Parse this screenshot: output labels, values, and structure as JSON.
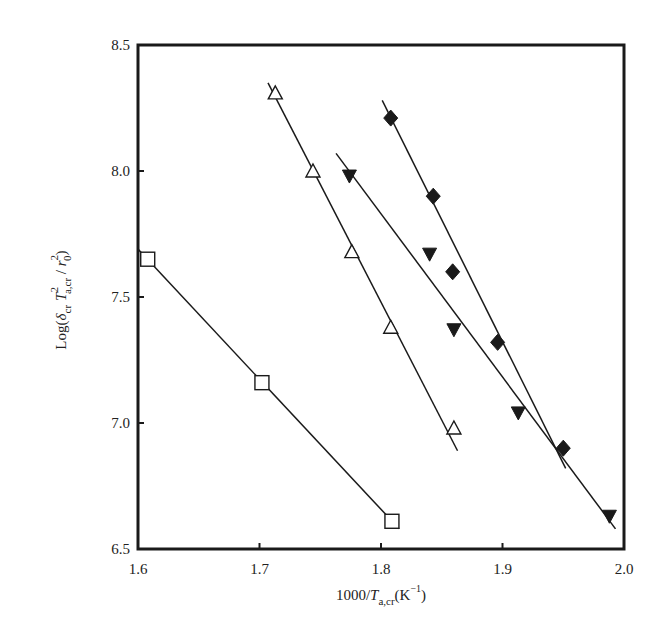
{
  "chart_data": {
    "type": "scatter",
    "title": "",
    "xlabel": "1000/T_a,cr (K^-1)",
    "ylabel": "Log(δ_cr T²_a,cr / r₀²)",
    "xlim": [
      1.6,
      2.0
    ],
    "ylim": [
      6.5,
      8.5
    ],
    "xticks": [
      1.6,
      1.7,
      1.8,
      1.9,
      2.0
    ],
    "xtick_labels": [
      "1.6",
      "1.7",
      "1.8",
      "1.9",
      "2.0"
    ],
    "yticks": [
      6.5,
      7.0,
      7.5,
      8.0,
      8.5
    ],
    "ytick_labels": [
      "6.5",
      "7.0",
      "7.5",
      "8.0",
      "8.5"
    ],
    "grid": false,
    "legend": null,
    "series": [
      {
        "name": "open-square",
        "marker": "square-open",
        "points": [
          [
            1.608,
            7.65
          ],
          [
            1.702,
            7.16
          ],
          [
            1.809,
            6.61
          ]
        ],
        "fit_line": [
          [
            1.6,
            7.69
          ],
          [
            1.815,
            6.58
          ]
        ]
      },
      {
        "name": "open-triangle",
        "marker": "triangle-up-open",
        "points": [
          [
            1.713,
            8.31
          ],
          [
            1.744,
            8.0
          ],
          [
            1.776,
            7.68
          ],
          [
            1.808,
            7.38
          ],
          [
            1.86,
            6.98
          ]
        ],
        "fit_line": [
          [
            1.707,
            8.35
          ],
          [
            1.863,
            6.89
          ]
        ]
      },
      {
        "name": "filled-triangle",
        "marker": "triangle-down-filled",
        "points": [
          [
            1.774,
            7.98
          ],
          [
            1.84,
            7.67
          ],
          [
            1.86,
            7.37
          ],
          [
            1.913,
            7.04
          ],
          [
            1.988,
            6.63
          ]
        ],
        "fit_line": [
          [
            1.763,
            8.07
          ],
          [
            1.993,
            6.58
          ]
        ]
      },
      {
        "name": "filled-diamond",
        "marker": "diamond-filled",
        "points": [
          [
            1.808,
            8.21
          ],
          [
            1.843,
            7.9
          ],
          [
            1.859,
            7.6
          ],
          [
            1.896,
            7.32
          ],
          [
            1.95,
            6.9
          ]
        ],
        "fit_line": [
          [
            1.801,
            8.28
          ],
          [
            1.952,
            6.82
          ]
        ]
      }
    ]
  },
  "axes": {
    "x_label_main": "1000/",
    "x_label_T": "T",
    "x_label_sub": "a,cr",
    "x_label_unit_open": "(K",
    "x_label_unit_sup": "−1",
    "x_label_unit_close": ")",
    "y_label_prefix": "Log(",
    "y_label_delta": "δ",
    "y_label_delta_sub": "cr",
    "y_label_T": "T",
    "y_label_T_sup": "2",
    "y_label_T_sub": "a,cr",
    "y_label_slash": " / ",
    "y_label_r": "r",
    "y_label_r_sup": "2",
    "y_label_r_sub": "0",
    "y_label_close": ")"
  },
  "colors": {
    "ink": "#1a1a1a",
    "background": "#ffffff"
  }
}
